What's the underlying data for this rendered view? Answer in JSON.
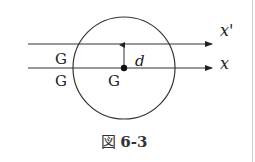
{
  "figure": {
    "caption_prefix": "図",
    "caption_number": "6-3",
    "labels": {
      "axis_parallel": "x'",
      "axis_center": "x",
      "distance": "d",
      "g_upper_left": "G",
      "g_lower_left": "G",
      "g_center": "G"
    }
  }
}
